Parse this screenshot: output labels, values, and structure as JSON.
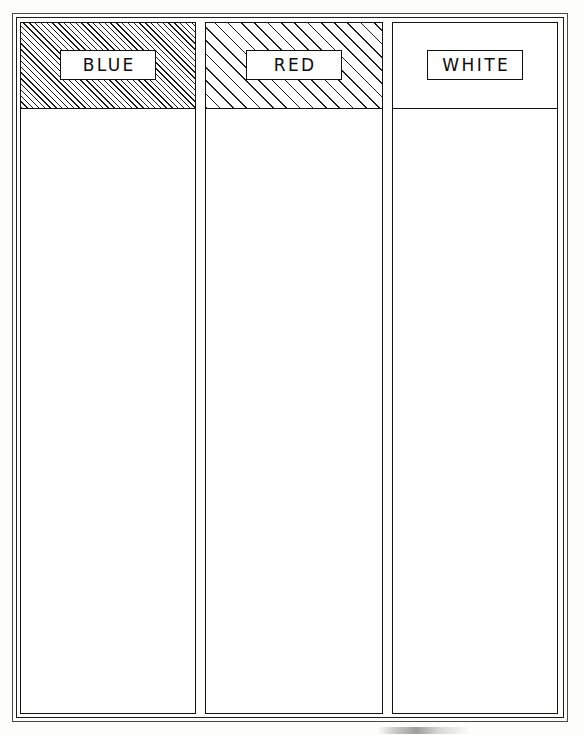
{
  "document": {
    "type": "hand-drawn worksheet diagram",
    "title": "",
    "background_color": "#fdfdfc",
    "ink_color": "#111111"
  },
  "frame": {
    "style": "double-line rectangular border"
  },
  "columns": [
    {
      "id": "blue",
      "label": "BLUE",
      "header_fill": "fine-diagonal-hatch",
      "header_fill_description": "dense diagonal hatching",
      "body_fill": "empty",
      "ink_color": "#111111"
    },
    {
      "id": "red",
      "label": "RED",
      "header_fill": "coarse-diagonal-hatch",
      "header_fill_description": "widely spaced diagonal hatching",
      "body_fill": "empty",
      "ink_color": "#111111"
    },
    {
      "id": "white",
      "label": "WHITE",
      "header_fill": "none",
      "header_fill_description": "blank / unshaded",
      "body_fill": "empty",
      "ink_color": "#111111"
    }
  ],
  "artifacts": {
    "bottom_smudge": ""
  }
}
